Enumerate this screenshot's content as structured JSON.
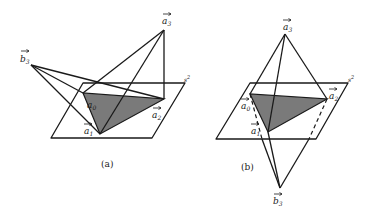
{
  "figure": {
    "panels": [
      {
        "id": "a",
        "caption": "(a)",
        "plane_label": "s",
        "plane_label_sup": "2",
        "vertices": {
          "a0": {
            "base": "a",
            "sub": "0"
          },
          "a1": {
            "base": "a",
            "sub": "1"
          },
          "a2": {
            "base": "a",
            "sub": "2"
          },
          "a3": {
            "base": "a",
            "sub": "3"
          },
          "b3": {
            "base": "b",
            "sub": "3"
          }
        }
      },
      {
        "id": "b",
        "caption": "(b)",
        "plane_label": "s",
        "plane_label_sup": "2",
        "vertices": {
          "a0": {
            "base": "a",
            "sub": "0"
          },
          "a1": {
            "base": "a",
            "sub": "1"
          },
          "a2": {
            "base": "a",
            "sub": "2"
          },
          "a3": {
            "base": "a",
            "sub": "3"
          },
          "b3": {
            "base": "b",
            "sub": "3"
          }
        }
      }
    ],
    "colors": {
      "line": "#1a1a1a",
      "shaded_triangle": "#7a7a7a",
      "background": "#ffffff"
    }
  }
}
